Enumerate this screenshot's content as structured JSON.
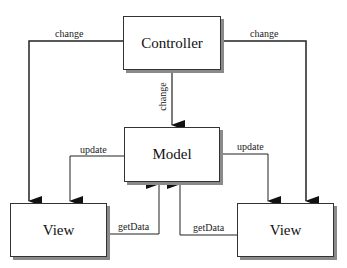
{
  "nodes": {
    "controller": {
      "label": "Controller"
    },
    "model": {
      "label": "Model"
    },
    "view_left": {
      "label": "View"
    },
    "view_right": {
      "label": "View"
    }
  },
  "edges": {
    "controller_to_view_left": {
      "label": "change"
    },
    "controller_to_view_right": {
      "label": "change"
    },
    "controller_to_model": {
      "label": "change"
    },
    "model_to_view_left": {
      "label": "update"
    },
    "model_to_view_right": {
      "label": "update"
    },
    "view_left_to_model": {
      "label": "getData"
    },
    "view_right_to_model": {
      "label": "getData"
    }
  },
  "colors": {
    "line": "#222222",
    "shadow": "#8a8a8a",
    "background": "#ffffff"
  }
}
